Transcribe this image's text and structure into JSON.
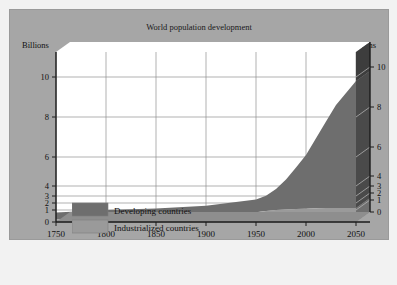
{
  "chart_data": {
    "type": "area",
    "title": "World population development",
    "xlabel": "",
    "ylabel": "Billions",
    "ylabel_right": "Billions",
    "xlim": [
      1750,
      2050
    ],
    "ylim": [
      0,
      10
    ],
    "grid": true,
    "legend_position": "bottom-left",
    "stacked": true,
    "y_ticks": [
      0,
      1,
      2,
      3,
      4,
      6,
      8,
      10
    ],
    "y_tick_labels": [
      "0",
      "1",
      "2",
      "3",
      "4",
      "6",
      "8",
      "10"
    ],
    "x_ticks": [
      1750,
      1800,
      1850,
      1900,
      1950,
      2000,
      2050
    ],
    "x_tick_labels": [
      "1750",
      "1800",
      "1850",
      "1900",
      "1950",
      "2000",
      "2050"
    ],
    "x": [
      1750,
      1800,
      1850,
      1900,
      1950,
      1960,
      1970,
      1980,
      1990,
      2000,
      2010,
      2020,
      2030,
      2040,
      2050
    ],
    "series": [
      {
        "name": "Industrialized countries",
        "color": "#9a9a9a",
        "values": [
          0.2,
          0.25,
          0.35,
          0.55,
          0.81,
          0.92,
          1.0,
          1.08,
          1.15,
          1.19,
          1.24,
          1.28,
          1.3,
          1.3,
          1.28
        ]
      },
      {
        "name": "Developing countries",
        "color": "#6e6e6e",
        "values": [
          0.6,
          0.75,
          0.85,
          1.05,
          1.69,
          2.1,
          2.7,
          3.37,
          4.12,
          4.91,
          5.7,
          6.5,
          7.3,
          7.9,
          8.52
        ]
      }
    ],
    "totals": [
      0.8,
      1.0,
      1.2,
      1.6,
      2.5,
      3.02,
      3.7,
      4.45,
      5.27,
      6.1,
      6.94,
      7.78,
      8.6,
      9.2,
      9.8
    ]
  },
  "legend": {
    "items": [
      {
        "label": "Developing countries",
        "color": "#6e6e6e"
      },
      {
        "label": "Industrialized countries",
        "color": "#9a9a9a"
      }
    ]
  },
  "colors": {
    "panel_background": "#a6a6a6",
    "plot_background": "#ffffff",
    "grid": "#8f8f8f",
    "axis": "#1a1a1a",
    "wall_dark": "#3d3d3d",
    "page_background": "#f2f2f2"
  }
}
